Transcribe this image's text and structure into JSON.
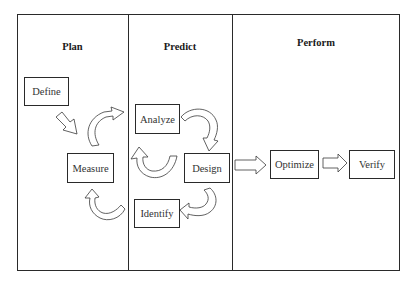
{
  "diagram": {
    "columns": [
      {
        "id": "plan",
        "title": "Plan"
      },
      {
        "id": "predict",
        "title": "Predict"
      },
      {
        "id": "perform",
        "title": "Perform"
      }
    ],
    "nodes": {
      "define": "Define",
      "measure": "Measure",
      "analyze": "Analyze",
      "design": "Design",
      "identify": "Identify",
      "optimize": "Optimize",
      "verify": "Verify"
    },
    "edges": [
      {
        "from": "Define",
        "to": "Measure",
        "style": "straight-block-arrow"
      },
      {
        "from": "Measure",
        "to": "Analyze",
        "style": "curved-block-arrow"
      },
      {
        "from": "Analyze",
        "to": "Design",
        "style": "curved-block-arrow"
      },
      {
        "from": "Design",
        "to": "Measure",
        "style": "curved-block-arrow"
      },
      {
        "from": "Design",
        "to": "Identify",
        "style": "curved-block-arrow"
      },
      {
        "from": "Identify",
        "to": "Measure",
        "style": "curved-block-arrow"
      },
      {
        "from": "Design",
        "to": "Optimize",
        "style": "straight-block-arrow"
      },
      {
        "from": "Optimize",
        "to": "Verify",
        "style": "straight-block-arrow"
      }
    ],
    "colors": {
      "stroke": "#2a2a2a",
      "fill": "#ffffff"
    }
  }
}
